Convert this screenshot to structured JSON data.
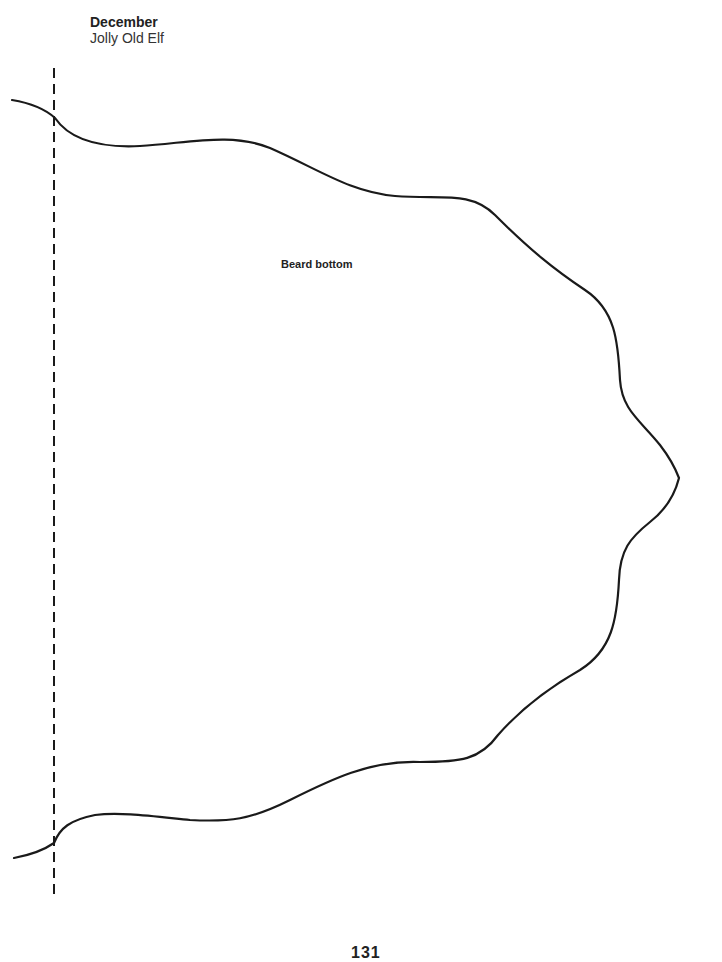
{
  "header": {
    "month": "December",
    "subtitle": "Jolly Old Elf"
  },
  "pattern": {
    "label": "Beard bottom",
    "fold_line": "dashed",
    "stroke_color": "#1a1a1a"
  },
  "footer": {
    "page_number": "131"
  }
}
